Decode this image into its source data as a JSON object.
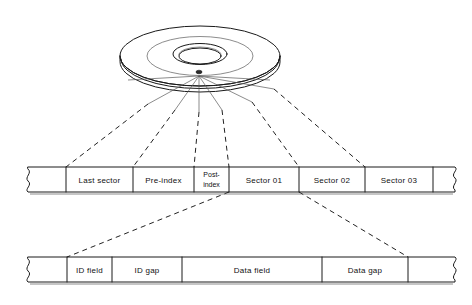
{
  "figure": {
    "colors": {
      "background": "#ffffff",
      "ink": "#1a1a1a",
      "leader": "#222222",
      "text": "#111111"
    }
  },
  "disk": {
    "name": "disk-platter",
    "description": "Isometric drawing of a rotating disk platter divided into sectors",
    "parts": [
      {
        "name": "outer-rim",
        "label": ""
      },
      {
        "name": "inner-ring",
        "label": ""
      },
      {
        "name": "center-hole",
        "label": ""
      },
      {
        "name": "index-hole",
        "label": ""
      },
      {
        "name": "sector-divider-lines",
        "label": ""
      }
    ]
  },
  "track_band": {
    "name": "track-band",
    "cells": [
      {
        "id": "break-left",
        "label": "",
        "x": 23,
        "width": 43,
        "break": "left"
      },
      {
        "id": "last-sector",
        "label": "Last sector",
        "x": 66,
        "width": 67,
        "break": ""
      },
      {
        "id": "pre-index",
        "label": "Pre-index",
        "x": 133,
        "width": 61,
        "break": ""
      },
      {
        "id": "post-index",
        "label": "Post-\nindex",
        "x": 194,
        "width": 35,
        "break": "",
        "multiline": true
      },
      {
        "id": "sector-01",
        "label": "Sector 01",
        "x": 229,
        "width": 70,
        "break": ""
      },
      {
        "id": "sector-02",
        "label": "Sector 02",
        "x": 299,
        "width": 66,
        "break": ""
      },
      {
        "id": "sector-03",
        "label": "Sector 03",
        "x": 365,
        "width": 68,
        "break": ""
      },
      {
        "id": "break-right",
        "label": "",
        "x": 433,
        "width": 26,
        "break": "right"
      }
    ]
  },
  "sector_band": {
    "name": "sector-detail-band",
    "cells": [
      {
        "id": "break-left",
        "label": "",
        "x": 23,
        "width": 44,
        "break": "left"
      },
      {
        "id": "id-field",
        "label": "ID field",
        "x": 67,
        "width": 45,
        "break": ""
      },
      {
        "id": "id-gap",
        "label": "ID gap",
        "x": 112,
        "width": 70,
        "break": ""
      },
      {
        "id": "data-field",
        "label": "Data field",
        "x": 182,
        "width": 140,
        "break": ""
      },
      {
        "id": "data-gap",
        "label": "Data gap",
        "x": 322,
        "width": 86,
        "break": ""
      },
      {
        "id": "break-right",
        "label": "",
        "x": 408,
        "width": 51,
        "break": "right"
      }
    ]
  },
  "leaders": {
    "name": "leader-lines",
    "disk_to_track": [
      {
        "from_x": 148,
        "from_y": 104,
        "to_x": 66,
        "to_y": 167
      },
      {
        "from_x": 175,
        "from_y": 110,
        "to_x": 133,
        "to_y": 167
      },
      {
        "from_x": 199,
        "from_y": 112,
        "to_x": 194,
        "to_y": 167
      },
      {
        "from_x": 222,
        "from_y": 110,
        "to_x": 229,
        "to_y": 167
      },
      {
        "from_x": 252,
        "from_y": 102,
        "to_x": 299,
        "to_y": 167
      },
      {
        "from_x": 274,
        "from_y": 89,
        "to_x": 365,
        "to_y": 167
      }
    ],
    "track_to_sector": [
      {
        "from_x": 229,
        "from_y": 192,
        "to_x": 67,
        "to_y": 257
      },
      {
        "from_x": 299,
        "from_y": 192,
        "to_x": 408,
        "to_y": 257
      }
    ]
  }
}
